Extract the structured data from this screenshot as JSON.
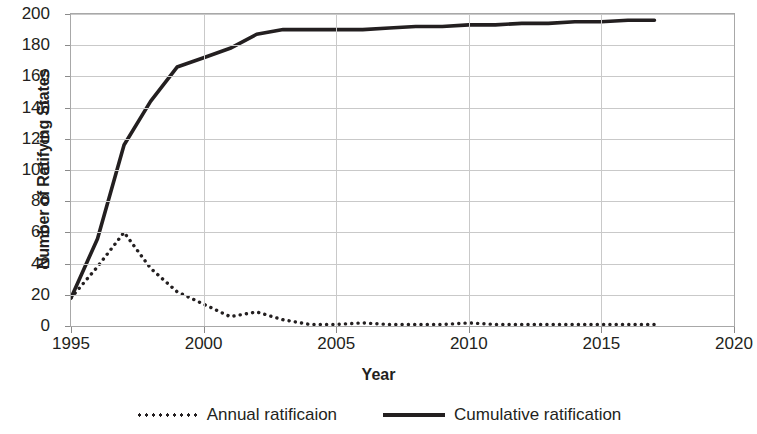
{
  "chart_data": {
    "type": "line",
    "title": "",
    "xlabel": "Year",
    "ylabel": "Number of Ratifying States",
    "xlim": [
      1995,
      2020
    ],
    "ylim": [
      0,
      200
    ],
    "grid": true,
    "legend_position": "bottom",
    "xticks": [
      "1995",
      "2000",
      "2005",
      "2010",
      "2015",
      "2020"
    ],
    "yticks": [
      "0",
      "20",
      "40",
      "60",
      "80",
      "100",
      "120",
      "140",
      "160",
      "180",
      "200"
    ],
    "x": [
      1995,
      1996,
      1997,
      1998,
      1999,
      2000,
      2001,
      2002,
      2003,
      2004,
      2005,
      2006,
      2007,
      2008,
      2009,
      2010,
      2011,
      2012,
      2013,
      2014,
      2015,
      2016,
      2017
    ],
    "series": [
      {
        "name": "Annual ratificaion",
        "style": "dotted",
        "color": "#231f20",
        "values": [
          18,
          38,
          60,
          37,
          22,
          14,
          6,
          9,
          4,
          1,
          1,
          2,
          1,
          1,
          1,
          2,
          1,
          1,
          1,
          1,
          1,
          1,
          1
        ]
      },
      {
        "name": "Cumulative ratification",
        "style": "solid",
        "color": "#231f20",
        "values": [
          18,
          56,
          116,
          144,
          166,
          172,
          178,
          187,
          190,
          190,
          190,
          190,
          191,
          192,
          192,
          193,
          193,
          194,
          194,
          195,
          195,
          196,
          196
        ]
      }
    ]
  },
  "legend": {
    "annual_label": "Annual ratificaion",
    "cumulative_label": "Cumulative ratification"
  }
}
